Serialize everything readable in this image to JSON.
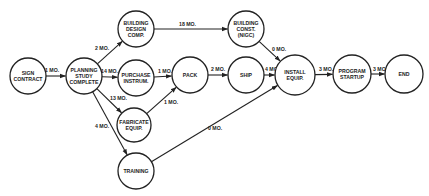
{
  "diagram": {
    "type": "pert-network",
    "nodes": [
      {
        "id": "sign",
        "lines": [
          "SIGN",
          "CONTRACT"
        ],
        "cx": 28,
        "cy": 76,
        "r": 18
      },
      {
        "id": "planning",
        "lines": [
          "PLANNING",
          "STUDY",
          "COMPLETE"
        ],
        "cx": 84,
        "cy": 76,
        "r": 18
      },
      {
        "id": "bdesign",
        "lines": [
          "BUILDING",
          "DESIGN",
          "COMP."
        ],
        "cx": 136,
        "cy": 29,
        "r": 18
      },
      {
        "id": "purchase",
        "lines": [
          "PURCHASE",
          "INSTRUM."
        ],
        "cx": 136,
        "cy": 78,
        "r": 18
      },
      {
        "id": "fabricate",
        "lines": [
          "FABRICATE",
          "EQUIP."
        ],
        "cx": 134,
        "cy": 125,
        "r": 17
      },
      {
        "id": "training",
        "lines": [
          "TRAINING"
        ],
        "cx": 136,
        "cy": 171,
        "r": 18
      },
      {
        "id": "pack",
        "lines": [
          "PACK"
        ],
        "cx": 190,
        "cy": 75,
        "r": 18
      },
      {
        "id": "ship",
        "lines": [
          "SHIP"
        ],
        "cx": 246,
        "cy": 75,
        "r": 18
      },
      {
        "id": "bconst",
        "lines": [
          "BUILDING",
          "CONST.",
          "(NIGC)"
        ],
        "cx": 246,
        "cy": 29,
        "r": 18
      },
      {
        "id": "install",
        "lines": [
          "INSTALL",
          "EQUIP."
        ],
        "cx": 295,
        "cy": 75,
        "r": 20
      },
      {
        "id": "program",
        "lines": [
          "PROGRAM",
          "STARTUP"
        ],
        "cx": 352,
        "cy": 74,
        "r": 19
      },
      {
        "id": "end",
        "lines": [
          "END"
        ],
        "cx": 404,
        "cy": 74,
        "r": 19
      }
    ],
    "edges": [
      {
        "from": "sign",
        "to": "planning",
        "label": "1 MO.",
        "lx": 45,
        "ly": 72
      },
      {
        "from": "planning",
        "to": "bdesign",
        "label": "2 MO.",
        "lx": 95,
        "ly": 50
      },
      {
        "from": "planning",
        "to": "purchase",
        "label": "14 MO.",
        "lx": 101,
        "ly": 73
      },
      {
        "from": "planning",
        "to": "fabricate",
        "label": "13 MO.",
        "lx": 110,
        "ly": 100
      },
      {
        "from": "planning",
        "to": "training",
        "label": "4 MO.",
        "lx": 95,
        "ly": 128
      },
      {
        "from": "bdesign",
        "to": "bconst",
        "label": "18 MO.",
        "lx": 179,
        "ly": 26
      },
      {
        "from": "purchase",
        "to": "pack",
        "label": "1 MO.",
        "lx": 158,
        "ly": 73
      },
      {
        "from": "fabricate",
        "to": "pack",
        "label": "1 MO.",
        "lx": 164,
        "ly": 104
      },
      {
        "from": "pack",
        "to": "ship",
        "label": "2 MO.",
        "lx": 211,
        "ly": 71
      },
      {
        "from": "bconst",
        "to": "install",
        "label": "0 MO.",
        "lx": 272,
        "ly": 51
      },
      {
        "from": "ship",
        "to": "install",
        "label": "4 MO.",
        "lx": 265,
        "ly": 71
      },
      {
        "from": "training",
        "to": "install",
        "label": "0 MO.",
        "lx": 208,
        "ly": 130
      },
      {
        "from": "install",
        "to": "program",
        "label": "3 MO.",
        "lx": 319,
        "ly": 71
      },
      {
        "from": "program",
        "to": "end",
        "label": "3 MO.",
        "lx": 373,
        "ly": 71
      }
    ]
  }
}
